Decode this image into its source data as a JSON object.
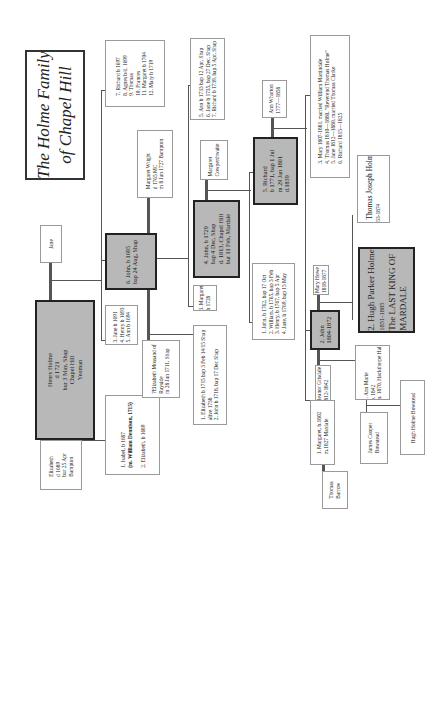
{
  "title": {
    "line1": "The Holme Family",
    "line2": "of  Chapel Hill"
  },
  "people": {
    "henry": [
      "Henry Holme",
      "d 1721",
      "bur 3 May, Shap",
      "Chapel Hill",
      "Yeoman"
    ],
    "jane_spouse": [
      "Jane"
    ],
    "elizabeth_spouse": [
      "Elizabeth",
      "d 1689",
      "bur 25 Apr",
      "Bampton"
    ],
    "isabel_group": [
      "1. Isabel, b 1687",
      "(m. William Dennison, 1715)",
      "",
      "2. Elizabeth, b 1689"
    ],
    "jane_group": [
      "3. Jane b 1691",
      "4. Henry  b 1693",
      "5. Ann  b 1694"
    ],
    "richard_group": [
      "7. Richard  b 1697",
      "8.  Agnes b/d. 1699",
      "9.   Thomas",
      "10. Frances",
      "11. Margaret b 1704",
      "12. Mary b 1719"
    ],
    "john1695": [
      "6. John,  b 1695",
      "bap 24 Aug, Shap"
    ],
    "margaret_wright": [
      "Margaret Wright",
      "d 1765 MC",
      "m 8 Jun 1727 Bampton"
    ],
    "elizabeth_mossand": [
      "?Elizabeth Mossand  of",
      "Rayside",
      "m 28 Jun 1711, Shap"
    ],
    "elizabeth1715_group": [
      "1. Elizabeth  b 1715 bap 3 Feb 14/15 Shap",
      "    alive 1738",
      "2. John b 1718, bap 17 Dec Shap"
    ],
    "margaret1728": [
      "3. Margaret",
      "b 1728"
    ],
    "john1729": [
      "4. John,  b 1729",
      "bap 4 Dec, Shap",
      "d. 1813, Chapel Hill",
      "bur 11 Feb, Mardale"
    ],
    "ann1733_group": [
      "5.  Ann  b 1733 bap 12 Apr, Shap",
      "6.  Jane b 1735, bap 27 Dec, Shap",
      "7.  Richard b 1739, bap 5 Apr, Shap"
    ],
    "margaret_cowperthwaite": [
      "Margaret",
      "Cowperthwaite"
    ],
    "richard1771": [
      "5. Richard",
      "b 1771, bap 1 Jul",
      "m 29 Jan 1801",
      "d.1839"
    ],
    "ann_wharton": [
      "Ann Wharton",
      "1777—1858"
    ],
    "john1762_group": [
      "1. John, b 1762,  bap 17 Oct",
      "2. William, b 1765, bap 3 Feb",
      "3. Henry,  b 1767, bap 5 Apr",
      "4. Jane, b 1769, bap 15 May"
    ],
    "mary1807_group": [
      "3. Mary 1807-1881.  married William Martindale",
      "4. Thomas 1810—1880,  \"Reverend Thomas Holme\"",
      "5. Jane 1812—1880,  married Thomas Clarke",
      "6. Richard 1815—1825"
    ],
    "thomas_joseph": [
      "3. Thomas Joseph Holme",
      "1853-1874"
    ],
    "hugh_parker": [
      "2. Hugh Parker Holme",
      "1851-1885",
      "The LAST KING OF",
      "MARDALE"
    ],
    "mary_howe": [
      "Mary Howe",
      "1818-1877"
    ],
    "john1804": [
      "2. John",
      "1804-1872"
    ],
    "eleanor_grisdale": [
      "Eleanor Grisdale",
      "1812-1842"
    ],
    "ann_marie": [
      "1. Ann Marie",
      "b. 1842",
      "m. 1870, Hackthorpe Hall"
    ],
    "margaret1802": [
      "1. Margaret, b.1802",
      "m.1827 Mardale"
    ],
    "thomas_barrow": [
      "Thomas",
      "Barrow"
    ],
    "james_cooper": [
      "James Cooper",
      "Bowstead"
    ],
    "hugh_bowstead": [
      "Hugh Holme Bowstead"
    ]
  },
  "colors": {
    "main_fill": "#b8b8b8",
    "border_dark": "#222222",
    "border_light": "#9a9a9a",
    "line": "#555555"
  }
}
